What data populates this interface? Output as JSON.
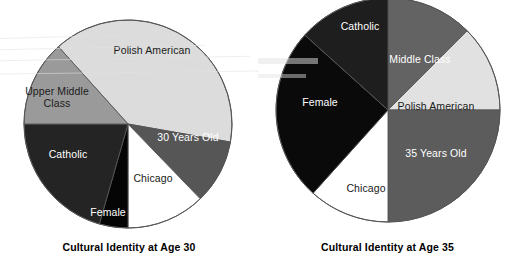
{
  "figure": {
    "background": "#ffffff",
    "text_color": "#000000"
  },
  "charts": [
    {
      "id": "age-30",
      "type": "pie",
      "title": "Cultural Identity at Age 30",
      "center": {
        "x": 128,
        "y": 124
      },
      "radius": 104,
      "outline_color": "#555555",
      "slices": [
        {
          "label": "Polish American",
          "start": 318,
          "end": 100,
          "value": 142,
          "fill": "#dcdcdc",
          "text_color": "#1a1a1a",
          "label_x": 152,
          "label_y": 54
        },
        {
          "label": "30 Years Old",
          "start": 100,
          "end": 136,
          "value": 36,
          "fill": "#565656",
          "text_color": "#ffffff",
          "label_x": 188,
          "label_y": 141
        },
        {
          "label": "Chicago",
          "start": 136,
          "end": 180,
          "value": 44,
          "fill": "#ffffff",
          "text_color": "#1a1a1a",
          "label_x": 153,
          "label_y": 182
        },
        {
          "label": "Female",
          "start": 180,
          "end": 196,
          "value": 16,
          "fill": "#050505",
          "text_color": "#ffffff",
          "label_x": 108,
          "label_y": 216
        },
        {
          "label": "Catholic",
          "start": 196,
          "end": 270,
          "value": 74,
          "fill": "#242424",
          "text_color": "#ffffff",
          "label_x": 68,
          "label_y": 158
        },
        {
          "label": "Upper Middle Class",
          "start": 270,
          "end": 318,
          "value": 48,
          "fill": "#9a9a9a",
          "text_color": "#1a1a1a",
          "label_x": 57,
          "label_y": 95,
          "line2": "Class"
        }
      ]
    },
    {
      "id": "age-35",
      "type": "pie",
      "title": "Cultural Identity at Age 35",
      "center": {
        "x": 130,
        "y": 110
      },
      "radius": 112,
      "outline_color": "#555555",
      "slices": [
        {
          "label": "Middle Class",
          "start": 0,
          "end": 45,
          "value": 45,
          "fill": "#636363",
          "text_color": "#ffffff",
          "label_x": 162,
          "label_y": 63
        },
        {
          "label": "Polish American",
          "start": 45,
          "end": 90,
          "value": 45,
          "fill": "#e1e1e1",
          "text_color": "#1a1a1a",
          "label_x": 178,
          "label_y": 110
        },
        {
          "label": "35 Years Old",
          "start": 90,
          "end": 180,
          "value": 90,
          "fill": "#5c5c5c",
          "text_color": "#ffffff",
          "label_x": 178,
          "label_y": 157
        },
        {
          "label": "Chicago",
          "start": 180,
          "end": 222,
          "value": 42,
          "fill": "#ffffff",
          "text_color": "#1a1a1a",
          "label_x": 108,
          "label_y": 192
        },
        {
          "label": "Female",
          "start": 222,
          "end": 312,
          "value": 90,
          "fill": "#0a0a0a",
          "text_color": "#ffffff",
          "label_x": 62,
          "label_y": 106
        },
        {
          "label": "Catholic",
          "start": 312,
          "end": 360,
          "value": 48,
          "fill": "#1e1e1e",
          "text_color": "#ffffff",
          "label_x": 102,
          "label_y": 30
        }
      ]
    }
  ],
  "chart_data": [
    {
      "type": "pie",
      "title": "Cultural Identity at Age 30",
      "categories": [
        "Polish American",
        "30 Years Old",
        "Chicago",
        "Female",
        "Catholic",
        "Upper Middle Class"
      ],
      "values": [
        142,
        36,
        44,
        16,
        74,
        48
      ],
      "units": "degrees of arc",
      "xlabel": "",
      "ylabel": "",
      "legend": "none",
      "grid": false,
      "annotations": [
        "Labels are drawn inside each wedge"
      ]
    },
    {
      "type": "pie",
      "title": "Cultural Identity at Age 35",
      "categories": [
        "Middle Class",
        "Polish American",
        "35 Years Old",
        "Chicago",
        "Female",
        "Catholic"
      ],
      "values": [
        45,
        45,
        90,
        42,
        90,
        48
      ],
      "units": "degrees of arc",
      "xlabel": "",
      "ylabel": "",
      "legend": "none",
      "grid": false,
      "annotations": [
        "Labels are drawn inside each wedge"
      ]
    }
  ]
}
